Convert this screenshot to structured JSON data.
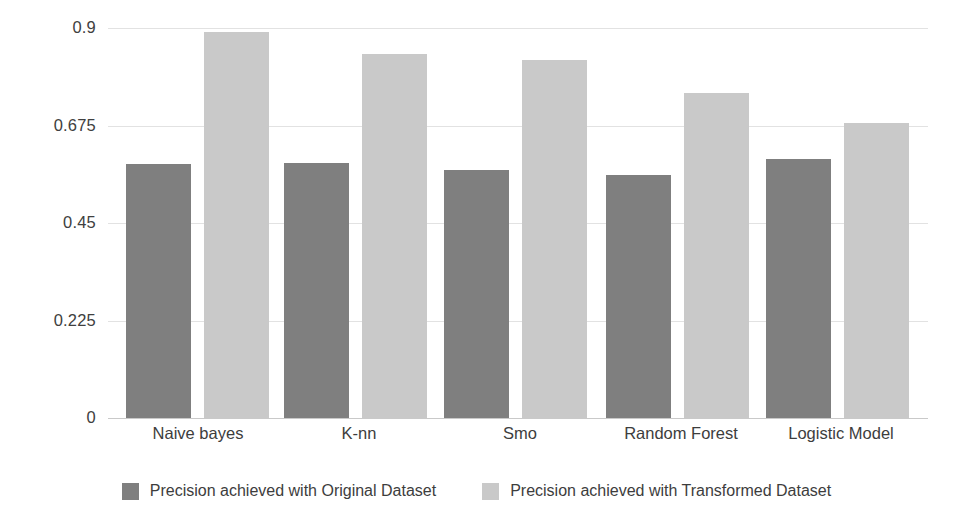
{
  "chart_data": {
    "type": "bar",
    "title": "",
    "subtitle": "",
    "xlabel": "",
    "ylabel": "",
    "categories": [
      "Naive bayes",
      "K-nn",
      "Smo",
      "Random Forest",
      "Logistic Model"
    ],
    "series": [
      {
        "name": "Precision achieved with Original Dataset",
        "color": "#7f7f7f",
        "values": [
          0.586,
          0.589,
          0.573,
          0.561,
          0.598
        ]
      },
      {
        "name": "Precision achieved with Transformed Dataset",
        "color": "#c9c9c9",
        "values": [
          0.891,
          0.84,
          0.826,
          0.75,
          0.681
        ]
      }
    ],
    "ylim": [
      0,
      0.9
    ],
    "yticks": [
      0,
      0.225,
      0.45,
      0.675,
      0.9
    ],
    "ytick_labels": [
      "0",
      "0.225",
      "0.45",
      "0.675",
      "0.9"
    ],
    "grid": true,
    "grid_axis": "y",
    "legend_position": "bottom",
    "background": "#ffffff"
  },
  "axis": {
    "y_tick_labels": [
      "0.9",
      "0.675",
      "0.45",
      "0.225",
      "0"
    ]
  },
  "legend": {
    "items": [
      {
        "label": "Precision achieved with Original Dataset",
        "swatch": "series-0"
      },
      {
        "label": "Precision achieved with Transformed Dataset",
        "swatch": "series-1"
      }
    ]
  }
}
